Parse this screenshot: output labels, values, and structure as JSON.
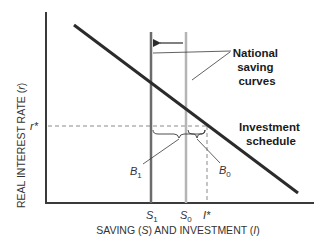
{
  "axes": {
    "y_label": "REAL INTEREST RATE (r)",
    "y_label_prefix": "REAL INTEREST RATE (",
    "y_label_var": "r",
    "y_label_suffix": ")",
    "x_label_prefix": "SAVING (",
    "x_label_var1": "S",
    "x_label_mid": ") AND INVESTMENT (",
    "x_label_var2": "I",
    "x_label_suffix": ")"
  },
  "ticks": {
    "r_star": "r*",
    "s1_main": "S",
    "s1_sub": "1",
    "s0_main": "S",
    "s0_sub": "0",
    "i_star": "I*"
  },
  "annotations": {
    "national_saving_line1": "National",
    "national_saving_line2": "saving",
    "national_saving_line3": "curves",
    "investment_line1": "Investment",
    "investment_line2": "schedule",
    "b1_main": "B",
    "b1_sub": "1",
    "b0_main": "B",
    "b0_sub": "0"
  },
  "colors": {
    "axis": "#3a3a3a",
    "investment": "#2b2b2b",
    "s1_curve": "#6b6b6b",
    "s0_curve": "#b5b5b5",
    "dashed": "#8a8a8a"
  }
}
